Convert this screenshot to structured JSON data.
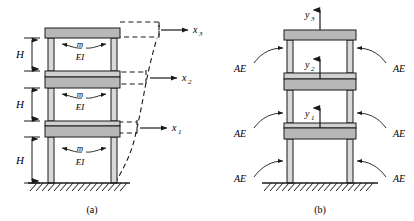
{
  "figure": {
    "panels": [
      {
        "id": "a",
        "caption": "(a)",
        "description": "Three-story shear frame with lateral degrees of freedom",
        "story_height_label": "H",
        "story_height_labels": [
          "H",
          "H",
          "H"
        ],
        "mass_label": "m",
        "stiffness_label": "EI",
        "mass_labels": [
          "m",
          "m",
          "m"
        ],
        "stiffness_labels": [
          "EI",
          "EI",
          "EI"
        ],
        "dof_labels": [
          "x_1",
          "x_2",
          "x_3"
        ],
        "dof_label_1": "x",
        "dof_sub_1": "1",
        "dof_sub_2": "2",
        "dof_sub_3": "3"
      },
      {
        "id": "b",
        "caption": "(b)",
        "description": "Three-story frame with vertical degrees of freedom and axial rigidity",
        "axial_label": "AE",
        "axial_labels": [
          "AE",
          "AE",
          "AE",
          "AE",
          "AE",
          "AE"
        ],
        "dof_labels": [
          "y_1",
          "y_2",
          "y_3"
        ],
        "dof_label_1": "y",
        "dof_sub_1": "1",
        "dof_sub_2": "2",
        "dof_sub_3": "3"
      }
    ]
  },
  "colors": {
    "line": "#1a1a1a",
    "slab_fill": "#b8b8b8",
    "column_fill": "#d9d9d9",
    "beam_fill": "#d0d0d0",
    "background": "#ffffff",
    "hatch": "#1a1a1a"
  }
}
